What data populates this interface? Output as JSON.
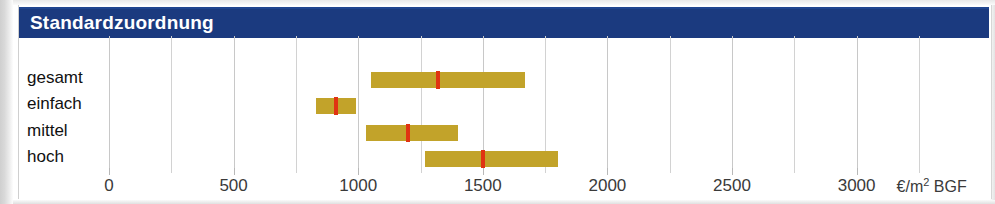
{
  "header": {
    "title": "Standardzuordnung"
  },
  "chart_data": {
    "type": "bar",
    "subtype": "range-bar-with-median-marker",
    "title": "Standardzuordnung",
    "xlabel": "€/m² BGF",
    "ylabel": "",
    "xlim": [
      0,
      3250
    ],
    "grid": true,
    "legend": false,
    "unit": "€/m² BGF",
    "categories": [
      "gesamt",
      "einfach",
      "mittel",
      "hoch"
    ],
    "xticks": [
      0,
      500,
      1000,
      1500,
      2000,
      2500,
      3000
    ],
    "xtick_labels": [
      "0",
      "500",
      "1000",
      "1500",
      "2000",
      "2500",
      "3000"
    ],
    "minor_xticks": [
      250,
      750,
      1250,
      1750,
      2250,
      2750,
      3250
    ],
    "series": [
      {
        "name": "Spannweite",
        "color": "#c2a32a"
      },
      {
        "name": "Mittelwert",
        "color": "#e03312"
      }
    ],
    "ranges": [
      {
        "category": "gesamt",
        "low": 1050,
        "high": 1670,
        "marker": 1320
      },
      {
        "category": "einfach",
        "low": 830,
        "high": 990,
        "marker": 910
      },
      {
        "category": "mittel",
        "low": 1030,
        "high": 1400,
        "marker": 1200
      },
      {
        "category": "hoch",
        "low": 1270,
        "high": 1800,
        "marker": 1500
      }
    ]
  },
  "axis": {
    "ticks": [
      {
        "label": "0",
        "value": 0
      },
      {
        "label": "500",
        "value": 500
      },
      {
        "label": "1000",
        "value": 1000
      },
      {
        "label": "1500",
        "value": 1500
      },
      {
        "label": "2000",
        "value": 2000
      },
      {
        "label": "2500",
        "value": 2500
      },
      {
        "label": "3000",
        "value": 3000
      }
    ],
    "unit_prefix": "€/m",
    "unit_exponent": "2",
    "unit_suffix": " BGF"
  },
  "rows": [
    {
      "label": "gesamt"
    },
    {
      "label": "einfach"
    },
    {
      "label": "mittel"
    },
    {
      "label": "hoch"
    }
  ],
  "colors": {
    "banner": "#1b3a7f",
    "bar": "#c2a32a",
    "marker": "#e03312",
    "grid": "#d2d2d2",
    "text": "#101010"
  }
}
